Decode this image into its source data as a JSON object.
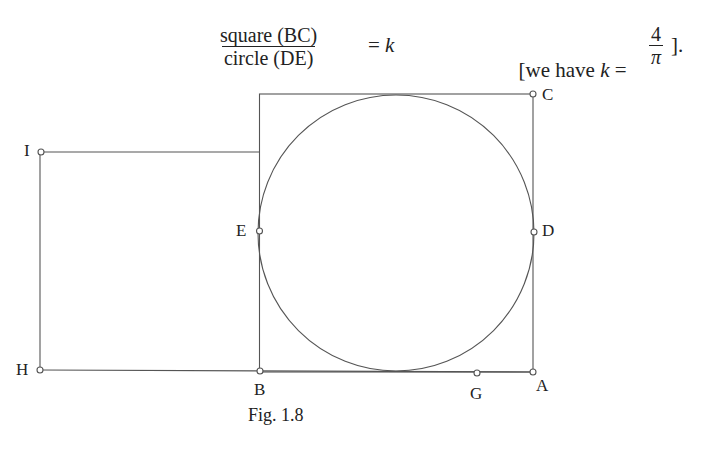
{
  "formula": {
    "numerator": "square (BC)",
    "denominator": "circle (DE)",
    "equals": "= ",
    "variable": "k"
  },
  "note": {
    "open": "[we have ",
    "variable": "k",
    "equals": " = ",
    "numerator": "4",
    "denominator": "π",
    "close": "]."
  },
  "points": {
    "I": "I",
    "H": "H",
    "B": "B",
    "G": "G",
    "A": "A",
    "C": "C",
    "D": "D",
    "E": "E"
  },
  "caption": "Fig. 1.8"
}
